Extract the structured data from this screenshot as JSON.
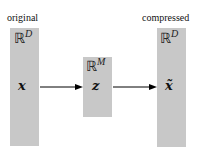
{
  "diagram": {
    "left": {
      "caption": "original",
      "space": "ℝ",
      "space_dim": "D",
      "variable": "x"
    },
    "middle": {
      "space": "ℝ",
      "space_dim": "M",
      "variable": "z"
    },
    "right": {
      "caption": "compressed",
      "space": "ℝ",
      "space_dim": "D",
      "variable": "x̃"
    },
    "arrows": [
      {
        "from": "x",
        "to": "z"
      },
      {
        "from": "z",
        "to": "x̃"
      }
    ],
    "colors": {
      "box_fill": "#c8c8c8",
      "arrow": "#000000",
      "background": "#ffffff"
    }
  }
}
